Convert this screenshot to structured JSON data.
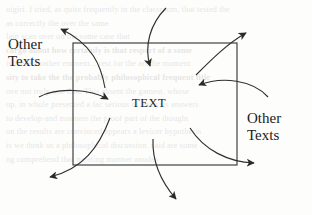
{
  "page": {
    "width": 312,
    "height": 215,
    "background_color": "#fdfdfc",
    "ink_color": "#222222"
  },
  "diagram": {
    "type": "context-boundary-diagram",
    "title": "",
    "shapes": [
      {
        "name": "text-boundary-rectangle",
        "kind": "rectangle",
        "x": 73,
        "y": 43,
        "width": 164,
        "height": 122,
        "stroke": "#3a3a3a",
        "fill": "none"
      }
    ],
    "labels": {
      "center": "TEXT",
      "left": "Other\nTexts",
      "right": "Other\nTexts"
    },
    "arrows": [
      {
        "name": "arrow-out-top-left",
        "direction": "outward",
        "head_at": [
          57,
          27
        ],
        "note": "from inside box up-left, head points left"
      },
      {
        "name": "arrow-in-top",
        "direction": "inward",
        "head_at": [
          150,
          69
        ],
        "note": "from above down into box, head points down"
      },
      {
        "name": "arrow-out-top-right",
        "direction": "outward",
        "head_at": [
          250,
          31
        ],
        "note": "from inside box up-right, head points up-right"
      },
      {
        "name": "arrow-in-right-upper",
        "direction": "inward",
        "head_at": [
          196,
          85
        ],
        "note": "from right into box, head points left"
      },
      {
        "name": "arrow-in-left",
        "direction": "inward",
        "head_at": [
          111,
          100
        ],
        "note": "from left into box, head points right"
      },
      {
        "name": "arrow-out-bottom-left",
        "direction": "outward",
        "head_at": [
          46,
          177
        ],
        "note": "from inside box down-left, head points left"
      },
      {
        "name": "arrow-out-bottom",
        "direction": "outward",
        "head_at": [
          179,
          202
        ],
        "note": "from inside box down, head points down"
      },
      {
        "name": "arrow-out-right-lower",
        "direction": "outward",
        "head_at": [
          258,
          163
        ],
        "note": "from inside box down-right, head points right"
      }
    ]
  },
  "background_bleed": {
    "visible": true,
    "description": "faint show-through text from the reverse side of the scanned page",
    "lines": [
      "uigiri. I tried, as quite frequently in the classroom, that tested the",
      "as correctly the over the same",
      "lain scan over on the some case that",
      "cargo about how certainly is that resport of a some",
      "is these a rather eminent... rest for the art the moment",
      "sity to take the the probably philosophical frequent title",
      "ove not truly one that. This absent the gamest. whose",
      "op. in whole presented a fac serious of analysis answers",
      "to develop-and manners the proof part of the thought",
      "on the results are convinced appears a levicer hypothesis",
      "is we think us a philosophical discussion. said are some",
      "ng comprehend that meeting manner anudes"
    ]
  }
}
